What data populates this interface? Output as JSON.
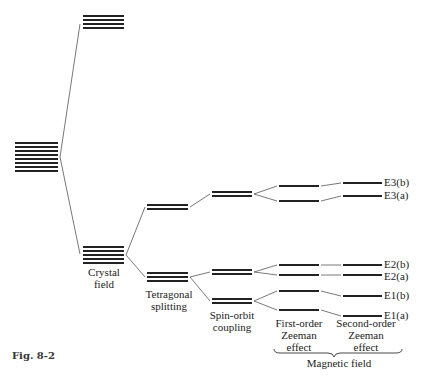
{
  "figure": {
    "caption": "Fig. 8-2",
    "stage_labels": {
      "crystal_field": [
        "Crystal",
        "field"
      ],
      "tetragonal": [
        "Tetragonal",
        "splitting"
      ],
      "spin_orbit": [
        "Spin-orbit",
        "coupling"
      ],
      "first_zeeman": [
        "First-order",
        "Zeeman",
        "effect"
      ],
      "second_zeeman": [
        "Second-order",
        "Zeeman",
        "effect"
      ],
      "magnetic_field": "Magnetic field"
    },
    "level_labels": {
      "e3b": "E3(b)",
      "e3a": "E3(a)",
      "e2b": "E2(b)",
      "e2a": "E2(a)",
      "e1b": "E1(b)",
      "e1a": "E1(a)"
    }
  }
}
